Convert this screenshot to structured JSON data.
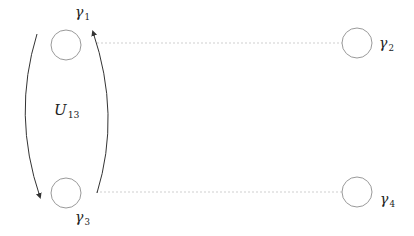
{
  "diagram": {
    "title": "",
    "colors": {
      "circle_stroke": "#9a9a9a",
      "arc_stroke": "#333333",
      "dotted_line": "#cfcfcf",
      "text": "#222222"
    },
    "nodes": [
      {
        "id": "gamma1",
        "symbol": "γ",
        "subscript": "1",
        "cx": 66,
        "cy": 45,
        "r": 15
      },
      {
        "id": "gamma2",
        "symbol": "γ",
        "subscript": "2",
        "cx": 357,
        "cy": 43,
        "r": 15
      },
      {
        "id": "gamma3",
        "symbol": "γ",
        "subscript": "3",
        "cx": 66,
        "cy": 193,
        "r": 15
      },
      {
        "id": "gamma4",
        "symbol": "γ",
        "subscript": "4",
        "cx": 357,
        "cy": 192,
        "r": 15
      }
    ],
    "connections": [
      {
        "from": "gamma1",
        "to": "gamma2",
        "style": "dotted"
      },
      {
        "from": "gamma3",
        "to": "gamma4",
        "style": "dotted"
      }
    ],
    "operator": {
      "symbol": "U",
      "subscript": "13",
      "description": "braiding arrows exchanging gamma1 and gamma3"
    },
    "arrows": [
      {
        "id": "left-arc",
        "direction": "down",
        "from": "gamma1",
        "to": "gamma3"
      },
      {
        "id": "right-arc",
        "direction": "up",
        "from": "gamma3",
        "to": "gamma1"
      }
    ]
  }
}
